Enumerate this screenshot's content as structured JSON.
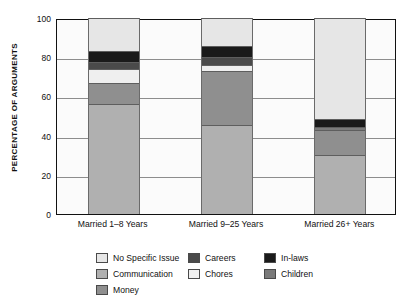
{
  "chart_data": {
    "type": "bar",
    "subtype": "stacked-bar-100",
    "title": "",
    "xlabel": "",
    "ylabel": "PERCENTAGE OF ARGUMENTS",
    "ylim": [
      0,
      100
    ],
    "yticks": [
      0,
      20,
      40,
      60,
      80,
      100
    ],
    "grid": true,
    "legend_position": "bottom",
    "categories": [
      "Married 1–8 Years",
      "Married 9–25 Years",
      "Married 26+ Years"
    ],
    "series": [
      {
        "name": "Communication",
        "color": "#b0b0b0",
        "values": [
          56.0,
          45.5,
          30.0
        ]
      },
      {
        "name": "Money",
        "color": "#8f8f8f",
        "values": [
          11.0,
          27.5,
          13.0
        ]
      },
      {
        "name": "Children",
        "color": "#7a7a7a",
        "values": [
          0.0,
          0.0,
          1.5
        ]
      },
      {
        "name": "Chores",
        "color": "#efefef",
        "values": [
          7.0,
          3.0,
          0.0
        ]
      },
      {
        "name": "Careers",
        "color": "#4a4a4a",
        "values": [
          3.5,
          4.0,
          0.0
        ]
      },
      {
        "name": "In-laws",
        "color": "#1a1a1a",
        "values": [
          5.5,
          5.5,
          4.0
        ]
      },
      {
        "name": "No Specific Issue",
        "color": "#e6e6e6",
        "values": [
          17.0,
          14.5,
          51.5
        ]
      }
    ],
    "stack_order_bottom_to_top": [
      "Communication",
      "Money",
      "Children",
      "Chores",
      "Careers",
      "In-laws",
      "No Specific Issue"
    ]
  },
  "axis": {
    "y_title": "PERCENTAGE OF ARGUMENTS",
    "y_tick_labels": [
      "100",
      "80",
      "60",
      "40",
      "20",
      "0"
    ]
  },
  "legend": {
    "entries": [
      {
        "label": "No Specific Issue",
        "color": "#e6e6e6"
      },
      {
        "label": "Careers",
        "color": "#4a4a4a"
      },
      {
        "label": "In-laws",
        "color": "#1a1a1a"
      },
      {
        "label": "Communication",
        "color": "#b0b0b0"
      },
      {
        "label": "Chores",
        "color": "#efefef"
      },
      {
        "label": "Children",
        "color": "#7a7a7a"
      },
      {
        "label": "Money",
        "color": "#8f8f8f"
      }
    ]
  }
}
